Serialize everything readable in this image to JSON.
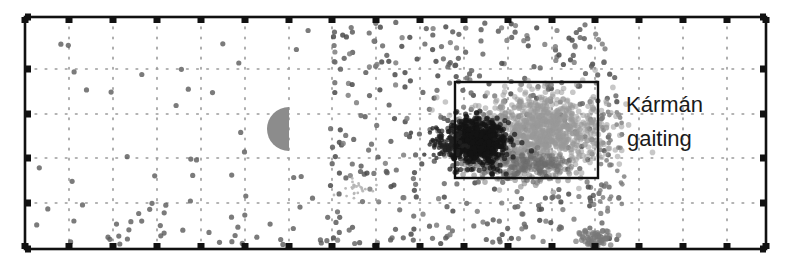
{
  "chart_data": {
    "type": "scatter",
    "title": "",
    "xlabel": "",
    "ylabel": "",
    "grid": true,
    "grid_style": "dotted",
    "legend": null,
    "axis_box_px": {
      "left": 25,
      "top": 17,
      "right": 766,
      "bottom": 249
    },
    "x_grid_px": [
      69,
      113,
      157,
      201,
      245,
      289,
      332,
      376,
      420,
      464,
      508,
      552,
      595,
      639,
      683,
      727
    ],
    "y_grid_px": [
      69,
      114,
      158,
      203
    ],
    "tick_labels": {
      "x": [],
      "y": []
    },
    "obstacle": {
      "shape": "half-disc",
      "side": "left",
      "cx": 289,
      "cy": 129,
      "r": 22,
      "color": "#8c8c8c"
    },
    "highlight_box": {
      "x0": 455,
      "y0": 82,
      "x1": 598,
      "y1": 178,
      "label": "Kármán gaiting"
    },
    "series": [
      {
        "name": "sparse wake points",
        "color": "#6e6e6e",
        "description": "scattered dots across plot, denser downstream (x>330) and near bottom"
      },
      {
        "name": "dense cluster (dark)",
        "color": "#1a1a1a",
        "center_px": [
          480,
          140
        ]
      },
      {
        "name": "dense cluster (mid gray)",
        "color": "#9a9a9a",
        "center_px": [
          540,
          125
        ]
      },
      {
        "name": "faint star cluster",
        "color": "#b5b5b5",
        "center_px": [
          355,
          188
        ]
      }
    ]
  },
  "annotation": {
    "line1": "Kármán",
    "line2": "gaiting"
  },
  "colors": {
    "axis": "#111111",
    "grid": "#9a9a9a",
    "box": "#111111",
    "obstacle": "#8c8c8c"
  }
}
